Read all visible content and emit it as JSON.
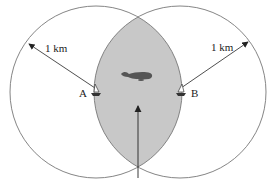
{
  "diagram": {
    "labels": {
      "left_distance": "1 km",
      "right_distance": "1 km",
      "station_a": "A",
      "station_b": "B"
    },
    "colors": {
      "overlap_fill": "#c8c8c8",
      "stroke": "#777777",
      "arrow": "#222222",
      "whale": "#555555"
    },
    "icons": [
      "boat-icon-a",
      "boat-icon-b",
      "whale-icon",
      "pointer-arrow"
    ]
  }
}
